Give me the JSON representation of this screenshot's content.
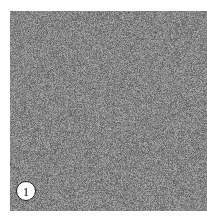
{
  "figure": {
    "type": "texture-sample-panel",
    "canvas": {
      "width": 207,
      "height": 222,
      "background_color": "#ffffff"
    },
    "panel": {
      "name": "noise-texture",
      "x": 10,
      "y": 11,
      "width": 197,
      "height": 200,
      "description": "fine-grained random grayscale speckle",
      "mean_gray": "#808080",
      "gray_min": "#4d4d4d",
      "gray_max": "#bfbfbf",
      "grain_size_px": 1
    },
    "badge": {
      "label": "1",
      "shape": "circle",
      "diameter": 20,
      "center_x": 26,
      "center_y": 191,
      "fill_color": "#ffffff",
      "border_color": "#1a1a1a",
      "text_color": "#111111"
    }
  }
}
